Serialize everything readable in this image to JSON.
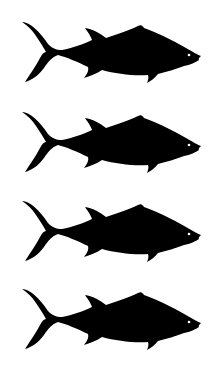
{
  "image": {
    "description": "Four identical black tuna silhouettes stacked vertically, facing right",
    "background": "#ffffff",
    "fill": "#000000",
    "eye_color": "#ffffff"
  },
  "fish": [
    {
      "label": "tuna-silhouette",
      "top": 2
    },
    {
      "label": "tuna-silhouette",
      "top": 92
    },
    {
      "label": "tuna-silhouette",
      "top": 181
    },
    {
      "label": "tuna-silhouette",
      "top": 269
    }
  ]
}
